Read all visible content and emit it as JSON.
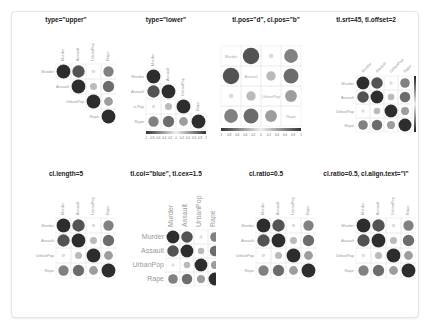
{
  "chart_data": {
    "type": "heatmap",
    "subtype": "corrplot-circle",
    "variables": [
      "Murder",
      "Assault",
      "UrbanPop",
      "Rape"
    ],
    "matrix": [
      [
        1.0,
        0.8,
        0.07,
        0.56
      ],
      [
        0.8,
        1.0,
        0.26,
        0.67
      ],
      [
        0.07,
        0.26,
        1.0,
        0.41
      ],
      [
        0.56,
        0.67,
        0.41,
        1.0
      ]
    ],
    "colorbar_ticks": [
      "-1",
      "-0.8",
      "-0.6",
      "-0.4",
      "-0.2",
      "0",
      "0.2",
      "0.4",
      "0.6",
      "0.8",
      "1"
    ],
    "panels": [
      {
        "title": "type=\"upper\"",
        "type": "upper",
        "tl_pos": "lt",
        "cl_pos": "r"
      },
      {
        "title": "type=\"lower\"",
        "type": "lower",
        "tl_pos": "lt",
        "cl_pos": "b"
      },
      {
        "title": "tl.pos=\"d\", cl.pos=\"b\"",
        "type": "full",
        "tl_pos": "d",
        "cl_pos": "b"
      },
      {
        "title": "tl.srt=45, tl.offset=2",
        "type": "full",
        "tl_pos": "lt",
        "tl_srt": 45,
        "cl_pos": "r"
      },
      {
        "title": "cl.length=5",
        "type": "full",
        "tl_pos": "lt",
        "cl_pos": "r",
        "cl_ticks": [
          "-1",
          "-0.5",
          "0",
          "0.5",
          "1"
        ]
      },
      {
        "title": "tl.col=\"blue\", tl.cex=1.5",
        "type": "full",
        "tl_pos": "lt",
        "cl_pos": "r",
        "tl_cex": 1.5
      },
      {
        "title": "cl.ratio=0.5",
        "type": "full",
        "tl_pos": "lt",
        "cl_pos": "r",
        "cl_ratio": 0.5
      },
      {
        "title": "cl.ratio=0.5, cl.align.text=\"l\"",
        "type": "full",
        "tl_pos": "lt",
        "cl_pos": "r",
        "cl_ratio": 0.5,
        "cl_align": "l"
      }
    ]
  }
}
